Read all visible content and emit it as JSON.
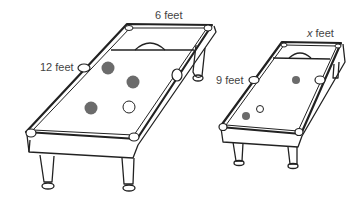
{
  "diagram": {
    "large_table": {
      "width_label": "6 feet",
      "length_label": "12 feet",
      "balls": [
        {
          "x": 108,
          "y": 68,
          "type": "dark"
        },
        {
          "x": 133,
          "y": 82,
          "type": "dark"
        },
        {
          "x": 92,
          "y": 108,
          "type": "dark"
        },
        {
          "x": 129,
          "y": 107,
          "type": "white"
        }
      ]
    },
    "small_table": {
      "width_label": "x feet",
      "length_label": "9 feet",
      "balls": [
        {
          "x": 296,
          "y": 80,
          "type": "dark"
        },
        {
          "x": 260,
          "y": 109,
          "type": "white"
        },
        {
          "x": 246,
          "y": 116,
          "type": "dark"
        }
      ]
    },
    "colors": {
      "line": "#222222",
      "ball_dark": "#6b6b6b",
      "ball_white": "#ffffff",
      "label": "#444444"
    }
  }
}
